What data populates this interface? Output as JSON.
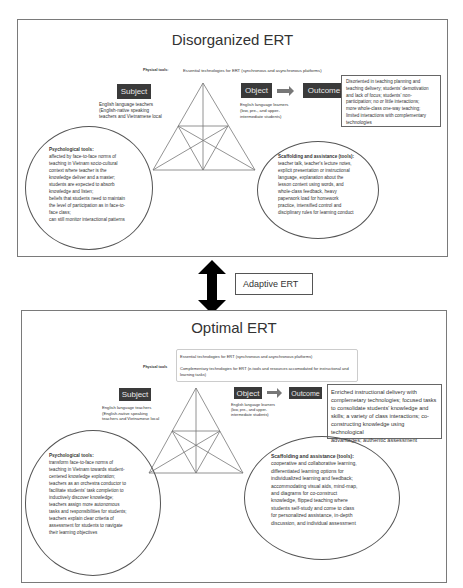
{
  "top_panel": {
    "title": "Disorganized ERT",
    "physical_tools_label": "Physical tools:",
    "physical_tools_text": "Essential technologies for ERT (synchronous and asynchronous platforms)",
    "subject": {
      "label": "Subject",
      "description": [
        "English language teachers",
        "(English-native speaking",
        "teachers and Vietnamese local"
      ]
    },
    "object": {
      "label": "Object",
      "description": [
        "English language learners",
        "(low, pre-, and upper-",
        "intermediate students)"
      ]
    },
    "outcome": {
      "label": "Outcome",
      "description": [
        "Disoriented in teaching planning and",
        "teaching delivery; students' demotivation",
        "and lack of focus; students' non-",
        "participation; no or little interactions;",
        "more whole-class one-way teaching;",
        "limited interactions with complementary",
        "technologies"
      ]
    },
    "psychological_tools": {
      "heading": "Psychological tools:",
      "lines": [
        "affected by face-to-face norms of",
        "teaching in Vietnam socio-cultural",
        "context where teacher is the",
        "knowledge deliver and a master;",
        "students are expected to absorb",
        "knowledge and listen;",
        "beliefs that students need to maintain",
        "the level of participation as in face-to-",
        "face class;",
        "can still monitor interactional patterns"
      ]
    },
    "scaffolding": {
      "heading": "Scaffolding and assistance (tools):",
      "lines": [
        "teacher talk, teacher's lecture notes,",
        "explicit presentation or instructional",
        "language, explanation about the",
        "lesson content using words, and",
        "whole-class feedback, heavy",
        "paperwork load for homework",
        "practice, intensified control and",
        "disciplinary rules for learning conduct"
      ]
    }
  },
  "transition": {
    "label": "Adaptive ERT",
    "arrow_icon": "double-headed-vertical-arrow"
  },
  "bottom_panel": {
    "title": "Optimal ERT",
    "physical_tools_label": "Physical tools",
    "physical_tools_items": [
      "Essential technologies for ERT (synchronous and asynchronous platforms)",
      "Complementary technologies for ERT (e-tools and resources accomodated for instructional and learning tasks)"
    ],
    "subject": {
      "label": "Subject",
      "description": [
        "English language teachers",
        "(English-native speaking",
        "teachers and Vietnamese local"
      ]
    },
    "object": {
      "label": "Object",
      "description": [
        "English language learners",
        "(low, pre-, and upper-",
        "intermediate students)"
      ]
    },
    "outcome": {
      "label": "Outcome",
      "description": [
        "Enriched instructional delivery with",
        "complemetary technologies; focused tasks",
        "to consolidate students' knowledge and",
        "skills; a variety of class interactions; co-",
        "constructing knowledge using technological",
        "advantages; authentic assessment"
      ]
    },
    "psychological_tools": {
      "heading": "Psychological tools:",
      "lines": [
        "transform face-to-face norms of",
        "teaching in Vietnam towards student-",
        "centered knowledge exploration;",
        "teachers as an orchestra conductor to",
        "facilitate students' task completion to",
        "inductively discover knowledge;",
        "teachers assign more autonomous",
        "tasks and responsibilities for students;",
        "teachers explain clear criteria of",
        "assessment for students to navigate",
        "their learning objectives"
      ]
    },
    "scaffolding": {
      "heading": "Scaffolding and assistance (tools):",
      "lines": [
        "cooperative and collaborative learning,",
        "differentiated learning options for",
        "individualized learning and feedback;",
        "accommodating visual aids, mind-map,",
        "and diagrams for co-construct",
        "knowledge, flipped teaching where",
        "students self-study and come to class",
        "for personalized assistance, in-depth",
        "discussion, and individual assessment"
      ]
    }
  }
}
